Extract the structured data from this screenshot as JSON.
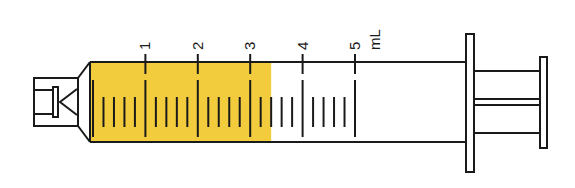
{
  "diagram": {
    "unit_label": "mL",
    "fill_color": "#f2cc3c",
    "line_color": "#1a1a1a",
    "fill_level_ml": 3.4,
    "scale": {
      "max_ml": 5,
      "major_ticks": [
        {
          "value": 1,
          "label": "1"
        },
        {
          "value": 2,
          "label": "2"
        },
        {
          "value": 3,
          "label": "3"
        },
        {
          "value": 4,
          "label": "4"
        },
        {
          "value": 5,
          "label": "5"
        }
      ],
      "minor_ticks_per_ml": 5
    }
  }
}
